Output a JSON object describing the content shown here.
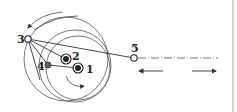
{
  "diagram": {
    "type": "mechanism-linkage",
    "colors": {
      "stroke": "#333333",
      "joint_fill": "#222222",
      "grey_joint": "#666666",
      "background": "#ffffff"
    },
    "points": [
      {
        "id": "1",
        "label": "1",
        "x": 78,
        "y": 68,
        "kind": "fixed-pivot"
      },
      {
        "id": "2",
        "label": "2",
        "x": 66,
        "y": 59,
        "kind": "fixed-pivot"
      },
      {
        "id": "3",
        "label": "3",
        "x": 28,
        "y": 39,
        "kind": "open-joint"
      },
      {
        "id": "4",
        "label": "4",
        "x": 48,
        "y": 65,
        "kind": "grey-joint"
      },
      {
        "id": "5",
        "label": "5",
        "x": 134,
        "y": 58,
        "kind": "open-joint"
      }
    ],
    "links": [
      [
        "3",
        "2"
      ],
      [
        "3",
        "4"
      ],
      [
        "4",
        "1"
      ],
      [
        "3",
        "5"
      ]
    ],
    "motion": {
      "slider_axis": "horizontal dash-dot line through point 5",
      "arrows": [
        "left",
        "right"
      ],
      "rotation_arrows": [
        "counterclockwise arc top-left",
        "clockwise arc around 1"
      ]
    }
  }
}
